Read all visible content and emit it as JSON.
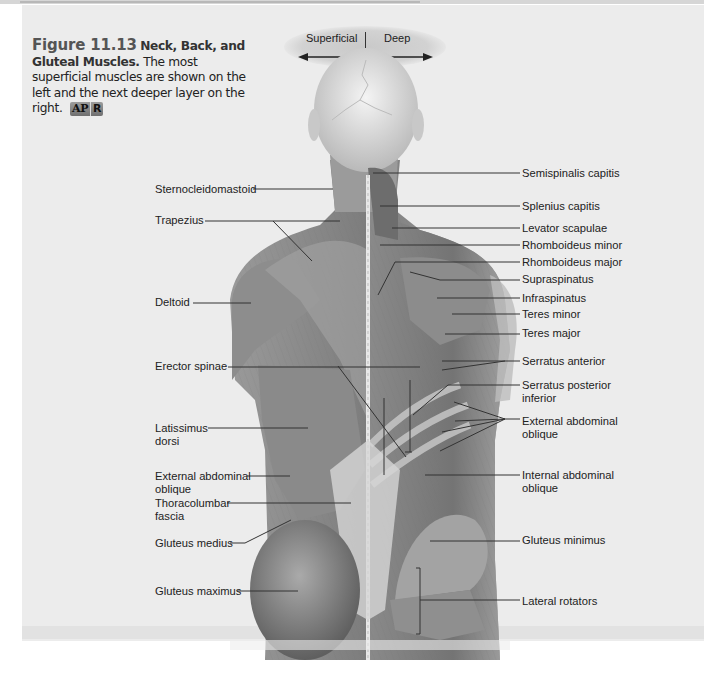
{
  "figure": {
    "number": "Figure 11.13",
    "title": "Neck, Back, and Gluteal Muscles.",
    "description": "The most superficial muscles are shown on the left and the next deeper layer on the right.",
    "badge": {
      "left": "AP",
      "right": "R"
    }
  },
  "orientation": {
    "left_label": "Superficial",
    "right_label": "Deep",
    "left_arrow_icon": "arrow-left",
    "right_arrow_icon": "arrow-right"
  },
  "labels_left": [
    {
      "text": "Sternocleidomastoid",
      "y": 189
    },
    {
      "text": "Trapezius",
      "y": 220
    },
    {
      "text": "Deltoid",
      "y": 300
    },
    {
      "text": "Erector spinae",
      "y": 365
    },
    {
      "text": "Latissimus dorsi",
      "y": 428
    },
    {
      "text": "External abdominal oblique",
      "y": 477
    },
    {
      "text": "Thoracolumbar fascia",
      "y": 503
    },
    {
      "text": "Gluteus medius",
      "y": 541
    },
    {
      "text": "Gluteus maximus",
      "y": 589
    }
  ],
  "labels_right": [
    {
      "text": "Semispinalis capitis",
      "y": 172
    },
    {
      "text": "Splenius capitis",
      "y": 205
    },
    {
      "text": "Levator scapulae",
      "y": 228
    },
    {
      "text": "Rhomboideus minor",
      "y": 245
    },
    {
      "text": "Rhomboideus major",
      "y": 261
    },
    {
      "text": "Supraspinatus",
      "y": 278
    },
    {
      "text": "Infraspinatus",
      "y": 298
    },
    {
      "text": "Teres minor",
      "y": 314
    },
    {
      "text": "Teres major",
      "y": 333
    },
    {
      "text": "Serratus anterior",
      "y": 361
    },
    {
      "text": "Serratus posterior inferior",
      "y": 385
    },
    {
      "text": "External abdominal oblique",
      "y": 421
    },
    {
      "text": "Internal abdominal oblique",
      "y": 475
    },
    {
      "text": "Gluteus minimus",
      "y": 539
    },
    {
      "text": "Lateral rotators",
      "y": 600
    }
  ],
  "colors": {
    "panel_bg": "#ececec",
    "badge_bg": "#8a8a8a",
    "leader_line": "#333333",
    "muscle_tone": "#8a8a8a"
  }
}
